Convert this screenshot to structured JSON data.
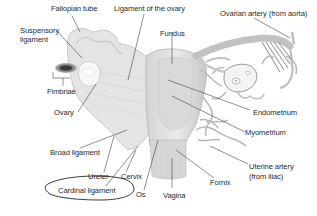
{
  "diagram": {
    "labels": {
      "fallopian_tube": "Fallopian tube",
      "ligament_of_ovary": "Ligament of the ovary",
      "ovarian_artery": "Ovarian artery (from aorta)",
      "suspensory_ligament_1": "Suspensory",
      "suspensory_ligament_2": "ligament",
      "fundus": "Fundus",
      "fimbriae": "Fimbriae",
      "ovary": "Ovary",
      "endometrium": "Endometrium",
      "myometrium": "Myometrium",
      "broad_ligament": "Broad ligament",
      "uterine_artery_1": "Uterine artery",
      "uterine_artery_2": "(from iliac)",
      "ureter": "Ureter",
      "cervix": "Cervix",
      "fornix": "Fornix",
      "cardinal_ligament": "Cardinal ligament",
      "os": "Os",
      "vagina": "Vagina"
    },
    "colors": {
      "tissue_light": "#e6e6e6",
      "tissue_mid": "#cfcfcf",
      "tissue_dark": "#a8a8a8",
      "vessel": "#b9b9b9",
      "leader_line": "#333333",
      "fimbriae_dark": "#555555"
    }
  }
}
